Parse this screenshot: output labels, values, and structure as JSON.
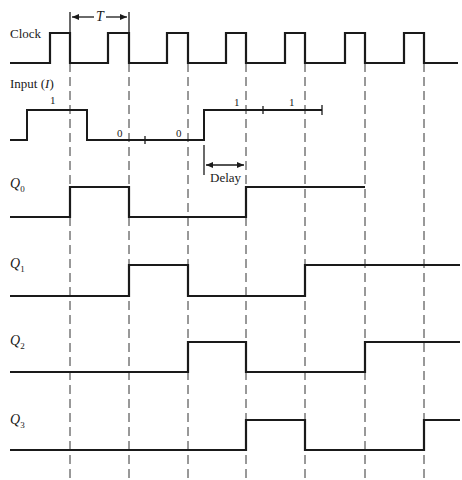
{
  "diagram": {
    "type": "timing-diagram",
    "clock": {
      "label": "Clock",
      "period_label": "T",
      "low_y": 63,
      "high_y": 33,
      "start_x": 10,
      "end_x": 458,
      "pulses": [
        [
          50,
          70
        ],
        [
          108,
          129
        ],
        [
          167,
          188
        ],
        [
          226,
          246
        ],
        [
          285,
          305
        ],
        [
          345,
          365
        ],
        [
          404,
          424
        ]
      ]
    },
    "dashed_lines_x": [
      70,
      129,
      188,
      246,
      305,
      365,
      424
    ],
    "dashed_top": 63,
    "dashed_bottom": 478,
    "input": {
      "label": "Input (",
      "label_var": "I",
      "label_close": ")",
      "low_y": 140,
      "high_y": 110,
      "start_x": 10,
      "end_x": 322,
      "high_segments": [
        [
          27,
          87
        ],
        [
          204,
          322
        ]
      ],
      "bits": [
        {
          "text": "1",
          "x": 50,
          "y": 104
        },
        {
          "text": "0",
          "x": 117,
          "y": 137
        },
        {
          "text": "0",
          "x": 176,
          "y": 137
        },
        {
          "text": "1",
          "x": 234,
          "y": 106
        },
        {
          "text": "1",
          "x": 289,
          "y": 106
        }
      ],
      "ticks_x": [
        145,
        263
      ],
      "end_bar_x": 322
    },
    "delay": {
      "label": "Delay",
      "x1": 204,
      "x2": 246,
      "y": 165
    },
    "outputs": [
      {
        "name": "Q",
        "sub": "0",
        "label_y": 188,
        "low_y": 217,
        "high_y": 187,
        "start_x": 10,
        "end_x": 365,
        "high_segments": [
          [
            70,
            129
          ],
          [
            246,
            365
          ]
        ]
      },
      {
        "name": "Q",
        "sub": "1",
        "label_y": 268,
        "low_y": 296,
        "high_y": 265,
        "start_x": 10,
        "end_x": 460,
        "high_segments": [
          [
            129,
            188
          ],
          [
            305,
            460
          ]
        ]
      },
      {
        "name": "Q",
        "sub": "2",
        "label_y": 345,
        "low_y": 372,
        "high_y": 342,
        "start_x": 10,
        "end_x": 460,
        "high_segments": [
          [
            188,
            246
          ],
          [
            365,
            460
          ]
        ]
      },
      {
        "name": "Q",
        "sub": "3",
        "label_y": 424,
        "low_y": 450,
        "high_y": 420,
        "start_x": 10,
        "end_x": 460,
        "high_segments": [
          [
            246,
            305
          ],
          [
            424,
            460
          ]
        ]
      }
    ]
  }
}
